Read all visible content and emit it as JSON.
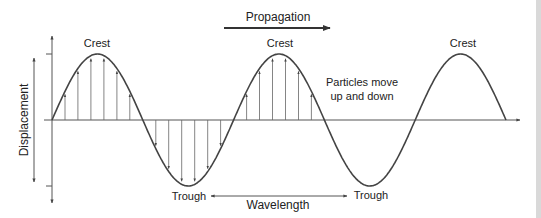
{
  "diagram": {
    "labels": {
      "propagation": "Propagation",
      "crest_1": "Crest",
      "crest_2": "Crest",
      "crest_3": "Crest",
      "trough_1": "Trough",
      "trough_2": "Trough",
      "wavelength": "Wavelength",
      "particles_line1": "Particles move",
      "particles_line2": "up and down",
      "displacement": "Displacement"
    },
    "wave": {
      "cycles_drawn": 2.5,
      "particle_arrows_first_crest": 6,
      "particle_arrows_first_trough": 6,
      "particle_arrows_second_crest": 6
    },
    "colors": {
      "line": "#444444",
      "text": "#222222",
      "background": "#ffffff"
    },
    "icons": {
      "propagation_arrow": "right-arrow-icon",
      "wavelength_arrow": "double-headed-arrow-icon",
      "displacement_arrow": "double-headed-vertical-arrow-icon"
    }
  }
}
